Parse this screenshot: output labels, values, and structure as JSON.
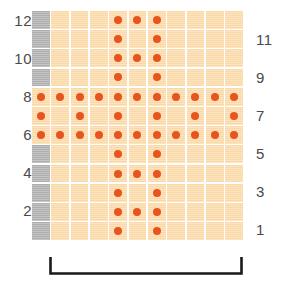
{
  "figure": {
    "kind": "knitting-stitch-chart",
    "colors": {
      "cell_background": "#fad9a6",
      "no_stitch_background": "#aeaeae",
      "dot_marker": "#e8541e",
      "grid_line": "#ffffff",
      "label_text": "#4a4a4a",
      "bracket": "#1a1a1a",
      "page_background": "#ffffff"
    },
    "grid": {
      "columns": 11,
      "rows": 12,
      "gray_columns": [
        1
      ],
      "row_order_top_to_bottom": [
        12,
        11,
        10,
        9,
        8,
        7,
        6,
        5,
        4,
        3,
        2,
        1
      ]
    }
  },
  "left_row_labels": [
    {
      "row": 12,
      "text": "12"
    },
    {
      "row": 10,
      "text": "10"
    },
    {
      "row": 8,
      "text": "8"
    },
    {
      "row": 6,
      "text": "6"
    },
    {
      "row": 4,
      "text": "4"
    },
    {
      "row": 2,
      "text": "2"
    }
  ],
  "right_row_labels": [
    {
      "row": 11,
      "text": "11"
    },
    {
      "row": 9,
      "text": "9"
    },
    {
      "row": 7,
      "text": "7"
    },
    {
      "row": 5,
      "text": "5"
    },
    {
      "row": 3,
      "text": "3"
    },
    {
      "row": 1,
      "text": "1"
    }
  ],
  "chart_data": {
    "type": "heatmap",
    "title": "",
    "subtitle": "",
    "xlabel": "",
    "ylabel": "",
    "legend_position": "none",
    "grid": true,
    "x": [
      1,
      2,
      3,
      4,
      5,
      6,
      7,
      8,
      9,
      10,
      11
    ],
    "categories": [
      "1",
      "2",
      "3",
      "4",
      "5",
      "6",
      "7",
      "8",
      "9",
      "10",
      "11"
    ],
    "y_rows_top_to_bottom": [
      12,
      11,
      10,
      9,
      8,
      7,
      6,
      5,
      4,
      3,
      2,
      1
    ],
    "xlim": [
      1,
      11
    ],
    "ylim": [
      1,
      12
    ],
    "cell_states": [
      {
        "row": 12,
        "cells": [
          "blank",
          "empty",
          "empty",
          "empty",
          "dot",
          "dot",
          "dot",
          "empty",
          "empty",
          "empty",
          "empty"
        ]
      },
      {
        "row": 11,
        "cells": [
          "blank",
          "empty",
          "empty",
          "empty",
          "dot",
          "empty",
          "dot",
          "empty",
          "empty",
          "empty",
          "empty"
        ]
      },
      {
        "row": 10,
        "cells": [
          "blank",
          "empty",
          "empty",
          "empty",
          "dot",
          "dot",
          "dot",
          "empty",
          "empty",
          "empty",
          "empty"
        ]
      },
      {
        "row": 9,
        "cells": [
          "blank",
          "empty",
          "empty",
          "empty",
          "dot",
          "empty",
          "dot",
          "empty",
          "empty",
          "empty",
          "empty"
        ]
      },
      {
        "row": 8,
        "cells": [
          "dot",
          "dot",
          "dot",
          "dot",
          "dot",
          "dot",
          "dot",
          "dot",
          "dot",
          "dot",
          "dot"
        ]
      },
      {
        "row": 7,
        "cells": [
          "dot",
          "empty",
          "dot",
          "empty",
          "dot",
          "empty",
          "dot",
          "empty",
          "dot",
          "empty",
          "dot"
        ]
      },
      {
        "row": 6,
        "cells": [
          "dot",
          "dot",
          "dot",
          "dot",
          "dot",
          "dot",
          "dot",
          "dot",
          "dot",
          "dot",
          "dot"
        ]
      },
      {
        "row": 5,
        "cells": [
          "blank",
          "empty",
          "empty",
          "empty",
          "dot",
          "empty",
          "dot",
          "empty",
          "empty",
          "empty",
          "empty"
        ]
      },
      {
        "row": 4,
        "cells": [
          "blank",
          "empty",
          "empty",
          "empty",
          "dot",
          "dot",
          "dot",
          "empty",
          "empty",
          "empty",
          "empty"
        ]
      },
      {
        "row": 3,
        "cells": [
          "blank",
          "empty",
          "empty",
          "empty",
          "dot",
          "empty",
          "dot",
          "empty",
          "empty",
          "empty",
          "empty"
        ]
      },
      {
        "row": 2,
        "cells": [
          "blank",
          "empty",
          "empty",
          "empty",
          "dot",
          "dot",
          "dot",
          "empty",
          "empty",
          "empty",
          "empty"
        ]
      },
      {
        "row": 1,
        "cells": [
          "blank",
          "empty",
          "empty",
          "empty",
          "dot",
          "empty",
          "dot",
          "empty",
          "empty",
          "empty",
          "empty"
        ]
      }
    ],
    "dot_counts_by_row": {
      "12": 3,
      "11": 2,
      "10": 3,
      "9": 2,
      "8": 11,
      "7": 6,
      "6": 11,
      "5": 2,
      "4": 3,
      "3": 2,
      "2": 3,
      "1": 2
    },
    "annotations": [
      {
        "name": "pattern-repeat-bracket",
        "spans_columns": [
          1,
          11
        ],
        "label": ""
      }
    ]
  }
}
